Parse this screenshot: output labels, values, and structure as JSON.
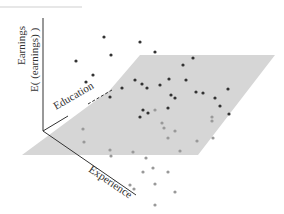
{
  "diagram": {
    "type": "3d-regression-plane",
    "axes": {
      "vertical_label_line1": "Earnings",
      "vertical_label_line2": "E( (earnings) )",
      "education_label": "Education",
      "experience_label": "Experience"
    },
    "colors": {
      "plane": "#d6d6d6",
      "axis": "#333333",
      "point_above": "#333333",
      "point_below": "#999999",
      "top_rule": "#cfcfcf"
    },
    "plane_polygon": [
      [
        140,
        55
      ],
      [
        275,
        55
      ],
      [
        198,
        155
      ],
      [
        22,
        155
      ],
      [
        110,
        90
      ]
    ],
    "points_above": [
      [
        76,
        61
      ],
      [
        104,
        37
      ],
      [
        140,
        42
      ],
      [
        111,
        55
      ],
      [
        93,
        75
      ],
      [
        155,
        52
      ],
      [
        86,
        82
      ],
      [
        110,
        97
      ],
      [
        135,
        80
      ],
      [
        142,
        84
      ],
      [
        122,
        88
      ],
      [
        147,
        88
      ],
      [
        183,
        65
      ],
      [
        169,
        79
      ],
      [
        186,
        80
      ],
      [
        193,
        58
      ],
      [
        160,
        85
      ],
      [
        171,
        95
      ],
      [
        196,
        92
      ],
      [
        175,
        98
      ],
      [
        215,
        98
      ],
      [
        203,
        93
      ],
      [
        228,
        89
      ],
      [
        148,
        113
      ],
      [
        140,
        117
      ],
      [
        143,
        110
      ],
      [
        168,
        108
      ],
      [
        229,
        114
      ],
      [
        220,
        106
      ]
    ],
    "points_below": [
      [
        83,
        129
      ],
      [
        84,
        142
      ],
      [
        110,
        150
      ],
      [
        133,
        152
      ],
      [
        155,
        110
      ],
      [
        164,
        128
      ],
      [
        162,
        123
      ],
      [
        212,
        117
      ],
      [
        175,
        131
      ],
      [
        212,
        121
      ],
      [
        168,
        138
      ],
      [
        213,
        138
      ],
      [
        197,
        141
      ],
      [
        180,
        151
      ],
      [
        146,
        158
      ],
      [
        143,
        172
      ],
      [
        111,
        156
      ],
      [
        153,
        168
      ],
      [
        168,
        172
      ],
      [
        134,
        189
      ],
      [
        130,
        185
      ],
      [
        155,
        184
      ],
      [
        175,
        192
      ],
      [
        155,
        205
      ]
    ]
  }
}
